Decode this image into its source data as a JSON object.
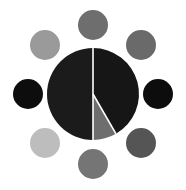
{
  "figure": {
    "title": "",
    "width": 186,
    "height": 190,
    "background_color": "#ffffff"
  },
  "chart_data": {
    "type": "pie",
    "title": "",
    "subtitle": "",
    "xlabel": "",
    "ylabel": "",
    "grid": false,
    "legend": "none",
    "center": {
      "cx": 93,
      "cy": 94
    },
    "radius": 46,
    "start_angle_deg": -90,
    "direction": "clockwise",
    "wedge_gap_color": "#ffffff",
    "wedge_gap_width": 1.6,
    "categories": [
      "Slice A",
      "Slice B",
      "Slice C"
    ],
    "values": [
      41.7,
      16.7,
      41.6
    ],
    "colors": [
      "#1b1b1b",
      "#6e6e6e",
      "#161616"
    ],
    "slices": [
      {
        "label": "Slice A",
        "value": 41.7,
        "color": "#161616",
        "start_deg": -90,
        "end_deg": 60
      },
      {
        "label": "Slice B",
        "value": 16.7,
        "color": "#6e6e6e",
        "start_deg": 60,
        "end_deg": 90
      },
      {
        "label": "Slice C",
        "value": 41.6,
        "color": "#1b1b1b",
        "start_deg": 90,
        "end_deg": 270
      }
    ],
    "satellites": {
      "count": 8,
      "orbit_radius": 79,
      "marker_radius": 15,
      "markers": [
        {
          "position": "top",
          "angle_deg": -90,
          "cx": 93,
          "cy": 25,
          "color": "#6e6e6e"
        },
        {
          "position": "top-right",
          "angle_deg": -45,
          "cx": 141,
          "cy": 45,
          "color": "#6a6a6a"
        },
        {
          "position": "right",
          "angle_deg": 0,
          "cx": 158,
          "cy": 94,
          "color": "#0d0d0d"
        },
        {
          "position": "bottom-right",
          "angle_deg": 45,
          "cx": 141,
          "cy": 143,
          "color": "#555555"
        },
        {
          "position": "bottom",
          "angle_deg": 90,
          "cx": 93,
          "cy": 164,
          "color": "#757575"
        },
        {
          "position": "bottom-left",
          "angle_deg": 135,
          "cx": 45,
          "cy": 143,
          "color": "#bdbdbd"
        },
        {
          "position": "left",
          "angle_deg": 180,
          "cx": 28,
          "cy": 94,
          "color": "#0d0d0d"
        },
        {
          "position": "top-left",
          "angle_deg": -135,
          "cx": 45,
          "cy": 45,
          "color": "#9a9a9a"
        }
      ]
    }
  }
}
